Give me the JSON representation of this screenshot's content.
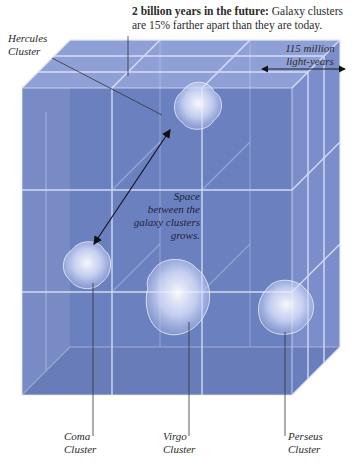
{
  "caption": {
    "bold_lead": "2 billion years in the future:",
    "body": " Galaxy clusters are 15% farther apart than they are today."
  },
  "scale_label": {
    "line1": "115 million",
    "line2": "light-years"
  },
  "space_annotation": {
    "line1": "Space",
    "line2": "between the",
    "line3": "galaxy clusters",
    "line4": "grows."
  },
  "clusters": [
    {
      "id": "hercules",
      "line1": "Hercules",
      "line2": "Cluster"
    },
    {
      "id": "coma",
      "line1": "Coma",
      "line2": "Cluster"
    },
    {
      "id": "virgo",
      "line1": "Virgo",
      "line2": "Cluster"
    },
    {
      "id": "perseus",
      "line1": "Perseus",
      "line2": "Cluster"
    }
  ],
  "colors": {
    "cube_front": "#6a7fbf",
    "cube_top": "#8fa0d6",
    "cube_side": "#7d90cc",
    "grid_line": "#dfe6fb",
    "text": "#2b2b2b"
  }
}
